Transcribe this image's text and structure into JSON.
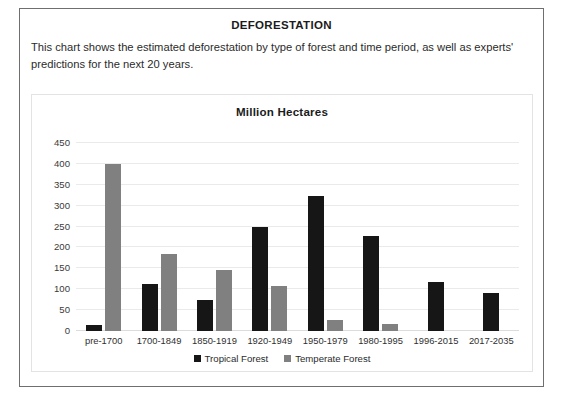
{
  "document": {
    "title": "DEFORESTATION",
    "description": "This chart shows the estimated deforestation by type of forest and time period, as well as experts' predictions for the next 20 years."
  },
  "colors": {
    "tropical": "#161616",
    "temperate": "#808080",
    "grid": "#eaeaea",
    "frame": "#6f6f6f",
    "card_border": "#e3e3e3"
  },
  "chart_data": {
    "type": "bar",
    "title": "Million Hectares",
    "xlabel": "",
    "ylabel": "",
    "ylim": [
      0,
      450
    ],
    "yticks": [
      0,
      50,
      100,
      150,
      200,
      250,
      300,
      350,
      400,
      450
    ],
    "ytick_labels": [
      "0",
      "50",
      "100",
      "150",
      "200",
      "250",
      "300",
      "350",
      "400",
      "450"
    ],
    "grid": true,
    "legend_position": "bottom",
    "categories": [
      "pre-1700",
      "1700-1849",
      "1850-1919",
      "1920-1949",
      "1950-1979",
      "1980-1995",
      "1996-2015",
      "2017-2035"
    ],
    "series": [
      {
        "name": "Tropical Forest",
        "color": "#161616",
        "values": [
          15,
          113,
          75,
          248,
          323,
          228,
          118,
          92
        ]
      },
      {
        "name": "Temperate Forest",
        "color": "#808080",
        "values": [
          400,
          185,
          147,
          108,
          26,
          16,
          0,
          0
        ]
      }
    ]
  }
}
